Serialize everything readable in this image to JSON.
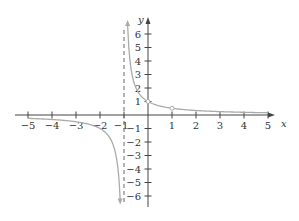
{
  "chart_data": {
    "type": "line",
    "title": "",
    "function": "y = 1/(x+1)",
    "xlabel": "x",
    "ylabel": "y",
    "xlim": [
      -5.5,
      5.5
    ],
    "ylim": [
      -6.5,
      6.8
    ],
    "x_ticks": [
      -5,
      -4,
      -3,
      -2,
      -1,
      1,
      2,
      3,
      4,
      5
    ],
    "y_ticks": [
      -6,
      -5,
      -4,
      -3,
      -2,
      -1,
      1,
      2,
      3,
      4,
      5,
      6
    ],
    "grid": false,
    "legend": null,
    "asymptotes": [
      {
        "type": "vertical",
        "x": -1,
        "style": "dashed"
      }
    ],
    "series": [
      {
        "name": "left branch",
        "x": [
          -5,
          -4,
          -3,
          -2,
          -1.5,
          -1.25,
          -1.16
        ],
        "y": [
          -0.25,
          -0.33,
          -0.5,
          -1,
          -2,
          -4,
          -6.25
        ]
      },
      {
        "name": "right branch",
        "x": [
          -0.85,
          -0.75,
          -0.5,
          0,
          1,
          2,
          3,
          4,
          5
        ],
        "y": [
          6.67,
          4,
          2,
          1,
          0.5,
          0.33,
          0.25,
          0.2,
          0.17
        ]
      }
    ],
    "marked_points": [
      {
        "x": 0,
        "y": 1,
        "style": "open-circle"
      },
      {
        "x": 1,
        "y": 0.5,
        "style": "open-circle"
      }
    ]
  },
  "axes": {
    "x_name": "x",
    "y_name": "y",
    "x_tick_labels": [
      "−5",
      "−4",
      "−3",
      "−2",
      "−1",
      "1",
      "2",
      "3",
      "4",
      "5"
    ],
    "y_tick_labels": [
      "6",
      "5",
      "4",
      "3",
      "2",
      "1",
      "−1",
      "−2",
      "−3",
      "−4",
      "−5",
      "−6"
    ]
  },
  "colors": {
    "axis": "#444444",
    "curve": "#aaaaaa",
    "asymptote": "#666666",
    "text": "#333333"
  }
}
